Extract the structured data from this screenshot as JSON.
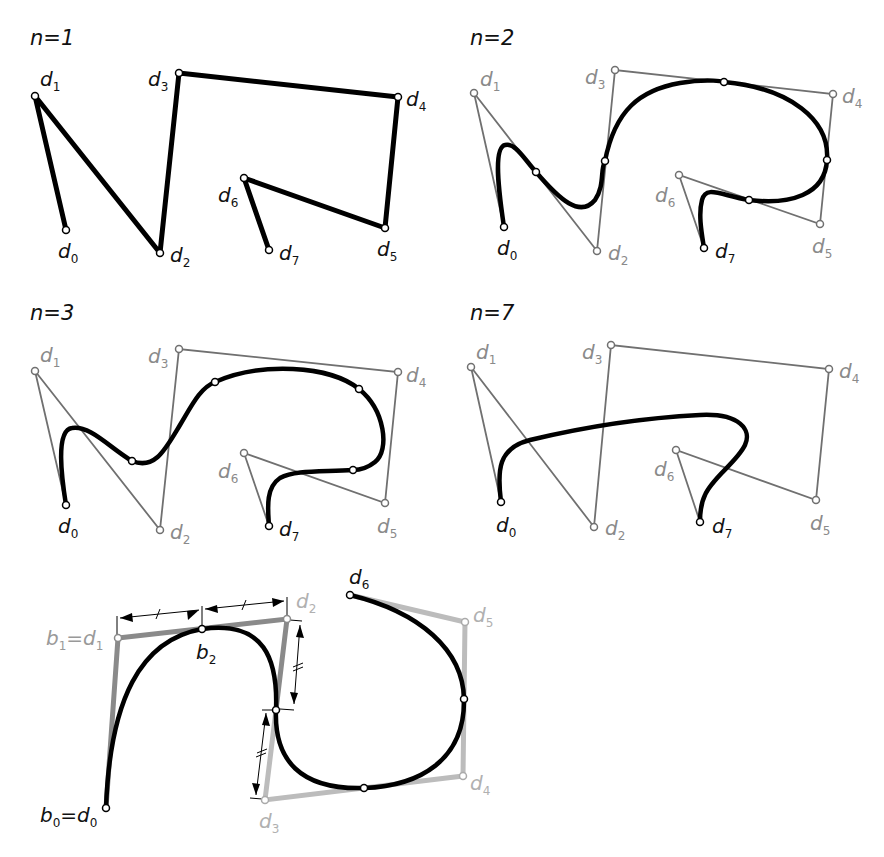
{
  "panels": [
    {
      "title": "n=1"
    },
    {
      "title": "n=2"
    },
    {
      "title": "n=3"
    },
    {
      "title": "n=7"
    }
  ],
  "labels": {
    "d": "d",
    "b": "b",
    "idx": [
      "0",
      "1",
      "2",
      "3",
      "4",
      "5",
      "6",
      "7"
    ],
    "b0_eq": "=d",
    "b1_eq": "=d"
  },
  "colors": {
    "curve": "#000000",
    "polygon_dark": "#707070",
    "polygon_light": "#b8b8b8",
    "label_gray": "#8a8a8a",
    "label_light": "#b0b0b0"
  }
}
